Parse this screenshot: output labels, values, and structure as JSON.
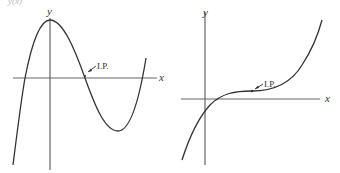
{
  "header_fragment": "y(x)",
  "graphs": [
    {
      "id": "left",
      "x_label": "x",
      "y_label": "y",
      "ip_label": "I.P.",
      "description": "cubic with negative leading coefficient shape: local max then local min, inflection point on x-axis"
    },
    {
      "id": "right",
      "x_label": "x",
      "y_label": "y",
      "ip_label": "I.P.",
      "description": "cubic with horizontal inflection point above x-axis"
    }
  ],
  "colors": {
    "stroke": "#333333",
    "axis": "#555555",
    "background": "#ffffff"
  }
}
